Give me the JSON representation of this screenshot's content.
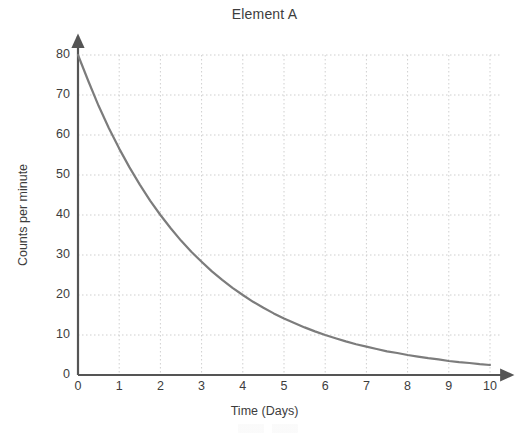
{
  "chart_data": {
    "type": "line",
    "title": "Element A",
    "xlabel": "Time (Days)",
    "ylabel": "Counts per minute",
    "xlim": [
      0,
      10
    ],
    "ylim": [
      0,
      80
    ],
    "xticks": [
      "0",
      "1",
      "2",
      "3",
      "4",
      "5",
      "6",
      "7",
      "8",
      "9",
      "10"
    ],
    "yticks": [
      "0",
      "10",
      "20",
      "30",
      "40",
      "50",
      "60",
      "70",
      "80"
    ],
    "grid": true,
    "legend": "none",
    "line_color": "#7c7c7c",
    "axis_color": "#555555",
    "grid_color": "#cfcfcf",
    "series": [
      {
        "name": "Element A",
        "x": [
          0,
          0.25,
          0.5,
          0.75,
          1,
          1.25,
          1.5,
          1.75,
          2,
          2.25,
          2.5,
          2.75,
          3,
          3.25,
          3.5,
          3.75,
          4,
          4.25,
          4.5,
          4.75,
          5,
          5.25,
          5.5,
          5.75,
          6,
          6.25,
          6.5,
          6.75,
          7,
          7.25,
          7.5,
          7.75,
          8,
          8.25,
          8.5,
          8.75,
          9,
          9.25,
          9.5,
          9.75,
          10
        ],
        "values": [
          80,
          73.5,
          67.3,
          61.7,
          56.6,
          51.9,
          47.6,
          43.6,
          40,
          36.7,
          33.6,
          30.8,
          28.3,
          25.9,
          23.8,
          21.8,
          20,
          18.3,
          16.8,
          15.4,
          14.1,
          13,
          11.9,
          10.9,
          10,
          9.2,
          8.4,
          7.7,
          7.1,
          6.5,
          5.9,
          5.5,
          5,
          4.6,
          4.2,
          3.9,
          3.5,
          3.2,
          3,
          2.7,
          2.5
        ]
      }
    ],
    "annotations": {
      "half_life_days": 2,
      "initial_count": 80
    }
  }
}
